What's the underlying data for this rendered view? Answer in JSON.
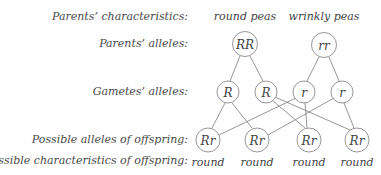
{
  "row_labels": {
    "parents_characteristics": "Parents’ characteristics:",
    "parents_alleles": "Parents’ alleles:",
    "gametes_alleles": "Gametes’ alleles:",
    "offspring_alleles": "Possible alleles of offspring:",
    "offspring_characteristics": "Possible characteristics of offspring:"
  },
  "parents": [
    {
      "characteristic": "round peas",
      "alleles": "RR"
    },
    {
      "characteristic": "wrinkly peas",
      "alleles": "rr"
    }
  ],
  "gametes": [
    "R",
    "R",
    "r",
    "r"
  ],
  "offspring": [
    {
      "alleles": "Rr",
      "characteristic": "round"
    },
    {
      "alleles": "Rr",
      "characteristic": "round"
    },
    {
      "alleles": "Rr",
      "characteristic": "round"
    },
    {
      "alleles": "Rr",
      "characteristic": "round"
    }
  ],
  "colors": {
    "stroke": "#8a8a8a",
    "text": "#444444",
    "background": "#ffffff"
  }
}
